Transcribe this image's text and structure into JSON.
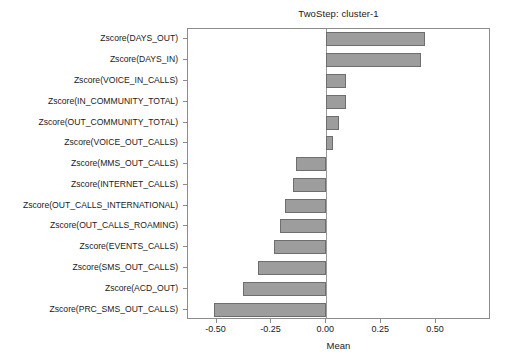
{
  "chart_data": {
    "type": "bar",
    "orientation": "horizontal",
    "title": "TwoStep: cluster-1",
    "xlabel": "Mean",
    "ylabel": "",
    "xlim": [
      -0.63,
      0.75
    ],
    "xticks": [
      -0.5,
      -0.25,
      0.0,
      0.25,
      0.5
    ],
    "xticklabels": [
      "-0.50",
      "-0.25",
      "0.00",
      "0.25",
      "0.50"
    ],
    "grid": false,
    "legend": null,
    "bar_color": "#9d9d9d",
    "bar_edge_color": "#6e6e6e",
    "zero_line_color": "#9a9a9a",
    "categories": [
      "Zscore(DAYS_OUT)",
      "Zscore(DAYS_IN)",
      "Zscore(VOICE_IN_CALLS)",
      "Zscore(IN_COMMUNITY_TOTAL)",
      "Zscore(OUT_COMMUNITY_TOTAL)",
      "Zscore(VOICE_OUT_CALLS)",
      "Zscore(MMS_OUT_CALLS)",
      "Zscore(INTERNET_CALLS)",
      "Zscore(OUT_CALLS_INTERNATIONAL)",
      "Zscore(OUT_CALLS_ROAMING)",
      "Zscore(EVENTS_CALLS)",
      "Zscore(SMS_OUT_CALLS)",
      "Zscore(ACD_OUT)",
      "Zscore(PRC_SMS_OUT_CALLS)"
    ],
    "values": [
      0.45,
      0.43,
      0.09,
      0.09,
      0.06,
      0.03,
      -0.14,
      -0.15,
      -0.19,
      -0.21,
      -0.24,
      -0.31,
      -0.38,
      -0.51
    ]
  }
}
